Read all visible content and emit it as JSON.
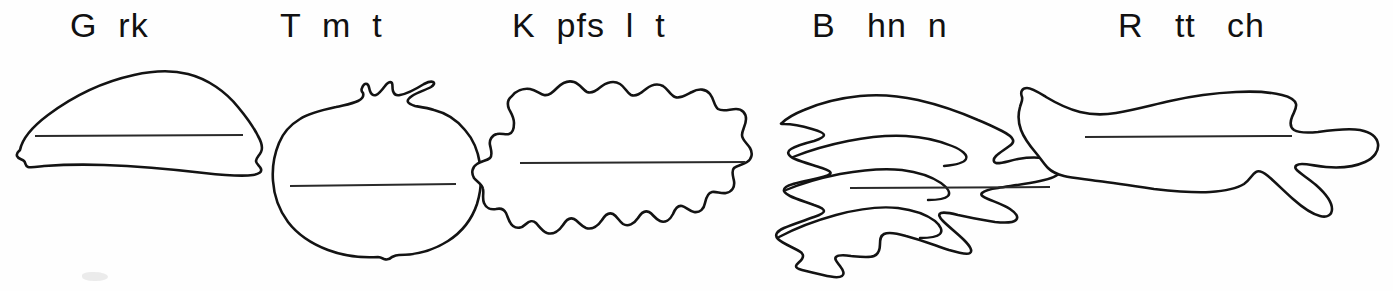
{
  "worksheet": {
    "title": "Gemüse Arbeitsblatt",
    "background_color": "#ffffff",
    "ink_color": "#131313",
    "line_color": "#2a2a2a"
  },
  "items": [
    {
      "id": "gurke",
      "label": "G  rk",
      "full_word": "Gurke",
      "shape": "cucumber-outline",
      "has_writing_line": true
    },
    {
      "id": "tomate",
      "label": "T  m  t",
      "full_word": "Tomate",
      "shape": "tomato-outline",
      "has_writing_line": true
    },
    {
      "id": "kopfsalat",
      "label": "K  pfs  l  t",
      "full_word": "Kopfsalat",
      "shape": "lettuce-outline",
      "has_writing_line": true
    },
    {
      "id": "bohnen",
      "label": "B   hn  n",
      "full_word": "Bohnen",
      "shape": "beans-outline",
      "has_writing_line": true
    },
    {
      "id": "rettich",
      "label": "R   tt   ch",
      "full_word": "Rettich",
      "shape": "radish-outline",
      "has_writing_line": true
    }
  ]
}
